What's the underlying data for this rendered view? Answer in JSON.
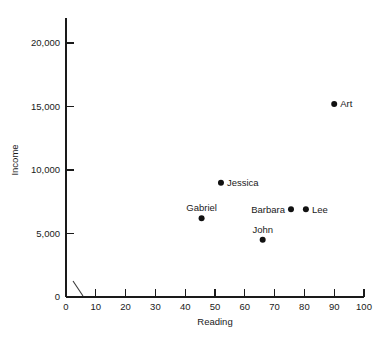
{
  "chart_data": {
    "type": "scatter",
    "title": "",
    "xlabel": "Reading",
    "ylabel": "Income",
    "xlim": [
      0,
      100
    ],
    "ylim": [
      0,
      20000
    ],
    "grid": false,
    "legend": "none",
    "x_ticks": [
      0,
      10,
      20,
      30,
      40,
      50,
      60,
      70,
      80,
      90,
      100
    ],
    "x_tick_labels": [
      "0",
      "10",
      "20",
      "30",
      "40",
      "50",
      "60",
      "70",
      "80",
      "90",
      "100"
    ],
    "y_ticks": [
      0,
      5000,
      10000,
      15000,
      20000
    ],
    "y_tick_labels": [
      "0",
      "5,000",
      "10,000",
      "15,000",
      "20,000"
    ],
    "axis_break_marker": true,
    "point_color": "#111111",
    "axis_color": "#1a1a1a",
    "points": [
      {
        "name": "Art",
        "x": 90.0,
        "y": 15200,
        "label_pos": "right"
      },
      {
        "name": "Jessica",
        "x": 52.0,
        "y": 9000,
        "label_pos": "right"
      },
      {
        "name": "Gabriel",
        "x": 45.5,
        "y": 6200,
        "label_pos": "above"
      },
      {
        "name": "Barbara",
        "x": 75.5,
        "y": 6900,
        "label_pos": "left"
      },
      {
        "name": "Lee",
        "x": 80.5,
        "y": 6900,
        "label_pos": "right"
      },
      {
        "name": "John",
        "x": 66.0,
        "y": 4500,
        "label_pos": "above"
      }
    ]
  }
}
